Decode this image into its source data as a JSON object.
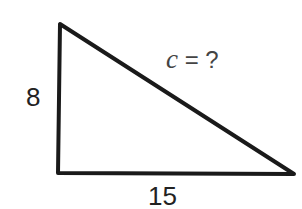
{
  "diagram": {
    "type": "right-triangle",
    "vertices": {
      "top": [
        60,
        24
      ],
      "right_angle": [
        58,
        173
      ],
      "right": [
        294,
        174
      ]
    },
    "stroke_color": "#1a1a1a",
    "labels": {
      "vertical_leg": "8",
      "horizontal_leg": "15",
      "hypotenuse_var": "c",
      "hypotenuse_rest": " = ?"
    }
  }
}
